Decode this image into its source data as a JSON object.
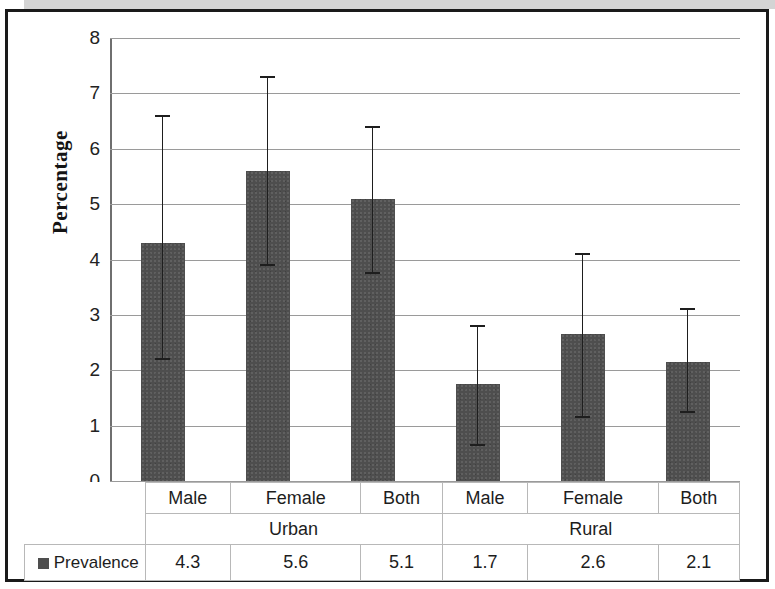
{
  "chart_data": {
    "type": "bar",
    "title": "",
    "xlabel": "",
    "ylabel": "Percentage",
    "ylim": [
      0,
      8
    ],
    "yticks": [
      0,
      1,
      2,
      3,
      4,
      5,
      6,
      7,
      8
    ],
    "ytick_labels": [
      "0",
      "1",
      "2",
      "3",
      "4",
      "5",
      "6",
      "7",
      "8"
    ],
    "grid": true,
    "legend_position": "bottom-left-table",
    "series_name": "Prevalence",
    "series_color": "#4e4e4e",
    "categories": [
      "Male",
      "Female",
      "Both",
      "Male",
      "Female",
      "Both"
    ],
    "groups": [
      {
        "label": "Urban",
        "span": 3
      },
      {
        "label": "Rural",
        "span": 3
      }
    ],
    "values": [
      4.3,
      5.6,
      5.1,
      1.7,
      2.6,
      2.1
    ],
    "value_labels": [
      "4.3",
      "5.6",
      "5.1",
      "1.7",
      "2.6",
      "2.1"
    ],
    "bar_tops": [
      4.3,
      5.6,
      5.1,
      1.75,
      2.65,
      2.15
    ],
    "error_bars": [
      {
        "low": 2.2,
        "high": 6.6
      },
      {
        "low": 3.9,
        "high": 7.3
      },
      {
        "low": 3.75,
        "high": 6.4
      },
      {
        "low": 0.65,
        "high": 2.8
      },
      {
        "low": 1.15,
        "high": 4.1
      },
      {
        "low": 1.25,
        "high": 3.1
      }
    ]
  },
  "table": {
    "legend_label": "Prevalence",
    "category_row": [
      "Male",
      "Female",
      "Both",
      "Male",
      "Female",
      "Both"
    ],
    "group_row": [
      "Urban",
      "Rural"
    ],
    "value_row": [
      "4.3",
      "5.6",
      "5.1",
      "1.7",
      "2.6",
      "2.1"
    ]
  },
  "colors": {
    "bar": "#4e4e4e",
    "error": "#1e1e1e",
    "grid": "#9a9a9a",
    "frame": "#1a1a1a",
    "band": "#d4d4d4"
  }
}
